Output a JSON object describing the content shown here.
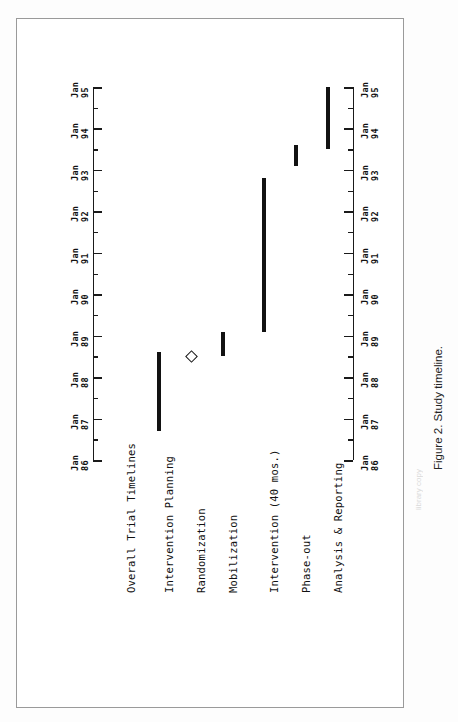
{
  "figure": {
    "caption": "Figure 2.  Study timeline.",
    "watermark": "library copy"
  },
  "chart_data": {
    "type": "bar",
    "orientation": "gantt-vertical-rotated",
    "title": "Overall Trial Timelines",
    "xlabel": "",
    "ylabel": "",
    "grid": false,
    "legend": null,
    "axis": {
      "name": "time",
      "ticks_major": [
        "Jan 86",
        "Jan 87",
        "Jan 88",
        "Jan 89",
        "Jan 90",
        "Jan 91",
        "Jan 92",
        "Jan 93",
        "Jan 94",
        "Jan 95"
      ],
      "tick_lines": [
        {
          "l1": "Jan",
          "l2": "86"
        },
        {
          "l1": "Jan",
          "l2": "87"
        },
        {
          "l1": "Jan",
          "l2": "88"
        },
        {
          "l1": "Jan",
          "l2": "89"
        },
        {
          "l1": "Jan",
          "l2": "90"
        },
        {
          "l1": "Jan",
          "l2": "91"
        },
        {
          "l1": "Jan",
          "l2": "92"
        },
        {
          "l1": "Jan",
          "l2": "93"
        },
        {
          "l1": "Jan",
          "l2": "94"
        },
        {
          "l1": "Jan",
          "l2": "95"
        }
      ],
      "minor_ticks": "half-year",
      "range": [
        "Jan 86",
        "Jan 95"
      ],
      "duplicated_on_both_sides": true
    },
    "categories": [
      "Intervention Planning",
      "Randomization",
      "Mobilization",
      "Intervention (40 mos.)",
      "Phase-out",
      "Analysis & Reporting"
    ],
    "bars": [
      {
        "label": "Intervention Planning",
        "marker": "bar",
        "start": "Jan 86.7",
        "end": "Jul 88.6",
        "start_val": 86.7,
        "end_val": 88.6
      },
      {
        "label": "Randomization",
        "marker": "diamond",
        "at": "Jul 88.5",
        "at_val": 88.5
      },
      {
        "label": "Mobilization",
        "marker": "bar",
        "start": "Jul 88.5",
        "end": "Jan 89.1",
        "start_val": 88.5,
        "end_val": 89.1
      },
      {
        "label": "Intervention (40 mos.)",
        "marker": "bar",
        "start": "Mar 89.1",
        "end": "Jul 92.8",
        "start_val": 89.1,
        "end_val": 92.8
      },
      {
        "label": "Phase-out",
        "marker": "bar",
        "start": "Jan 93.1",
        "end": "Jul 93.6",
        "start_val": 93.1,
        "end_val": 93.6
      },
      {
        "label": "Analysis & Reporting",
        "marker": "bar",
        "start": "Jul 93.5",
        "end": "Jan 95.0",
        "start_val": 93.5,
        "end_val": 95.0
      }
    ]
  }
}
